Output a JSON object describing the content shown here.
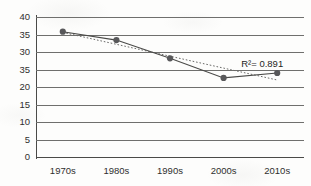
{
  "chart_data": {
    "type": "line",
    "title": "",
    "xlabel": "",
    "ylabel": "",
    "categories": [
      "1970s",
      "1980s",
      "1990s",
      "2000s",
      "2010s"
    ],
    "ylim": [
      0,
      40
    ],
    "y_tick_values": [
      40,
      35,
      30,
      25,
      20,
      15,
      10,
      5,
      0
    ],
    "y_tick_labels": [
      "40",
      "35",
      "30",
      "35",
      "20",
      "15",
      "10",
      "5",
      "0"
    ],
    "y_tick_label_note": "Fourth tick from top is printed as 35 in the source image where 25 would be expected",
    "grid": "horizontal",
    "legend": "none",
    "series": [
      {
        "name": "observed",
        "style": "solid-line-with-round-markers",
        "color": "#4a4a48",
        "marker_color": "#58585a",
        "values": [
          35.8,
          33.4,
          28.2,
          22.6,
          24.0
        ]
      },
      {
        "name": "linear-trendline",
        "style": "dotted-line",
        "color": "#6a6a68",
        "values": [
          35.6,
          32.2,
          28.8,
          25.4,
          22.0
        ]
      }
    ],
    "annotations": [
      {
        "name": "r-squared",
        "text": "R²= 0.891",
        "x_category": "2010s",
        "y_value": 26.5
      }
    ]
  },
  "colors": {
    "background": "#fdfdfc",
    "axis": "#4a4a48",
    "gridline": "#6f6f6d",
    "text": "#2f2f2e",
    "series_line": "#4a4a48",
    "marker": "#58585a",
    "trendline": "#6a6a68"
  }
}
